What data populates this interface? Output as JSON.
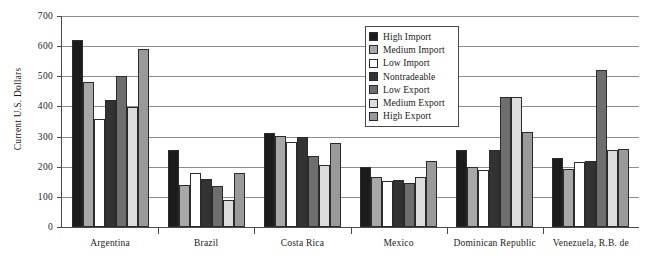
{
  "chart_data": {
    "type": "bar",
    "title": "",
    "xlabel": "",
    "ylabel": "Current U.S. Dollars",
    "ylim": [
      0,
      700
    ],
    "ytick_step": 100,
    "yticks": [
      0,
      100,
      200,
      300,
      400,
      500,
      600,
      700
    ],
    "grid": true,
    "legend_position": "top-center-right",
    "categories": [
      "Argentina",
      "Brazil",
      "Costa Rica",
      "Mexico",
      "Dominican Republic",
      "Venezuela, R.B. de"
    ],
    "series": [
      {
        "name": "High Import",
        "color": "#1c1c1c",
        "values": [
          620,
          257,
          312,
          198,
          257,
          230
        ]
      },
      {
        "name": "Medium Import",
        "color": "#a8a8a8",
        "values": [
          480,
          140,
          303,
          165,
          200,
          193
        ]
      },
      {
        "name": "Low Import",
        "color": "#ffffff",
        "values": [
          358,
          180,
          282,
          153,
          190,
          215
        ]
      },
      {
        "name": "Nontradeable",
        "color": "#333333",
        "values": [
          420,
          160,
          297,
          155,
          257,
          218
        ]
      },
      {
        "name": "Low Export",
        "color": "#6e6e6e",
        "values": [
          500,
          135,
          235,
          145,
          432,
          522
        ]
      },
      {
        "name": "Medium Export",
        "color": "#dcdcdc",
        "values": [
          398,
          88,
          205,
          165,
          432,
          255
        ]
      },
      {
        "name": "High Export",
        "color": "#9a9a9a",
        "values": [
          592,
          180,
          278,
          218,
          315,
          258
        ]
      }
    ]
  },
  "legend": {
    "items": [
      {
        "label": "High Import"
      },
      {
        "label": "Medium Import"
      },
      {
        "label": "Low Import"
      },
      {
        "label": "Nontradeable"
      },
      {
        "label": "Low Export"
      },
      {
        "label": "Medium Export"
      },
      {
        "label": "High Export"
      }
    ]
  }
}
